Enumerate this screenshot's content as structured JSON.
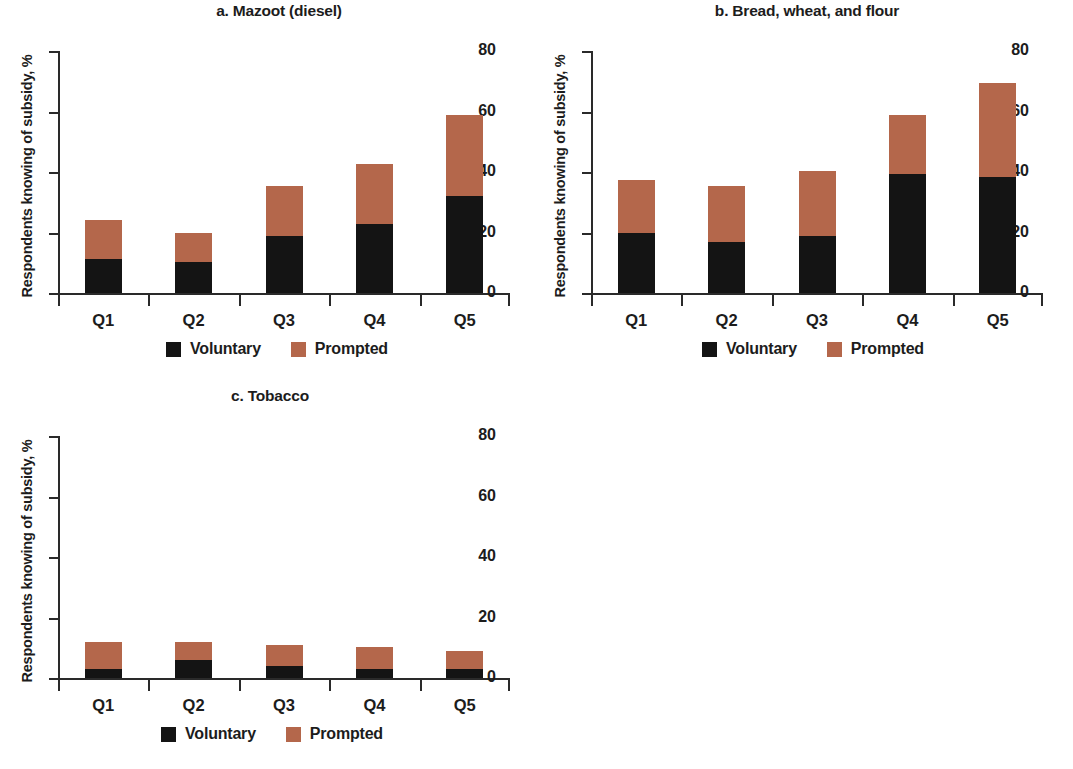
{
  "figure": {
    "background": "#ffffff",
    "ylabel": "Respondents knowing of subsidy, %",
    "legend": {
      "voluntary_label": "Voluntary",
      "prompted_label": "Prompted"
    },
    "colors": {
      "voluntary": "#141414",
      "prompted": "#b4674b",
      "axis": "#2a2a2a",
      "text": "#1c1c1c"
    }
  },
  "chart_data": [
    {
      "type": "bar",
      "panel": "a",
      "title": "a. Mazoot (diesel)",
      "stacked": true,
      "categories": [
        "Q1",
        "Q2",
        "Q3",
        "Q4",
        "Q5"
      ],
      "series": [
        {
          "name": "Voluntary",
          "color": "#141414",
          "values": [
            11.3,
            10.3,
            19.0,
            22.8,
            32.0
          ]
        },
        {
          "name": "Prompted",
          "color": "#b4674b",
          "values": [
            13.0,
            9.7,
            16.5,
            19.7,
            27.0
          ]
        }
      ],
      "totals": [
        24.3,
        20.0,
        35.5,
        42.5,
        59.0
      ],
      "xlabel": "",
      "ylabel": "Respondents knowing of subsidy, %",
      "ylim": [
        0,
        80
      ],
      "yticks": [
        0,
        20,
        40,
        60,
        80
      ],
      "ytick_labels": [
        "0",
        "20",
        "40",
        "60",
        "80"
      ],
      "grid": false,
      "legend_position": "bottom-center"
    },
    {
      "type": "bar",
      "panel": "b",
      "title": "b. Bread, wheat, and flour",
      "stacked": true,
      "categories": [
        "Q1",
        "Q2",
        "Q3",
        "Q4",
        "Q5"
      ],
      "series": [
        {
          "name": "Voluntary",
          "color": "#141414",
          "values": [
            20.0,
            17.0,
            18.7,
            39.5,
            38.5
          ]
        },
        {
          "name": "Prompted",
          "color": "#b4674b",
          "values": [
            17.2,
            18.5,
            21.5,
            19.5,
            30.8
          ]
        }
      ],
      "totals": [
        37.2,
        35.5,
        40.2,
        59.0,
        69.3
      ],
      "xlabel": "",
      "ylabel": "Respondents knowing of subsidy, %",
      "ylim": [
        0,
        80
      ],
      "yticks": [
        0,
        20,
        40,
        60,
        80
      ],
      "ytick_labels": [
        "0",
        "20",
        "40",
        "60",
        "80"
      ],
      "grid": false,
      "legend_position": "bottom-center"
    },
    {
      "type": "bar",
      "panel": "c",
      "title": "c. Tobacco",
      "stacked": true,
      "categories": [
        "Q1",
        "Q2",
        "Q3",
        "Q4",
        "Q5"
      ],
      "series": [
        {
          "name": "Voluntary",
          "color": "#141414",
          "values": [
            3.0,
            6.0,
            4.0,
            3.0,
            3.0
          ]
        },
        {
          "name": "Prompted",
          "color": "#b4674b",
          "values": [
            9.0,
            6.0,
            7.0,
            7.2,
            6.0
          ]
        }
      ],
      "totals": [
        12.0,
        12.0,
        11.0,
        10.2,
        9.0
      ],
      "xlabel": "",
      "ylabel": "Respondents knowing of subsidy, %",
      "ylim": [
        0,
        80
      ],
      "yticks": [
        0,
        20,
        40,
        60,
        80
      ],
      "ytick_labels": [
        "0",
        "20",
        "40",
        "60",
        "80"
      ],
      "grid": false,
      "legend_position": "bottom-center"
    }
  ]
}
